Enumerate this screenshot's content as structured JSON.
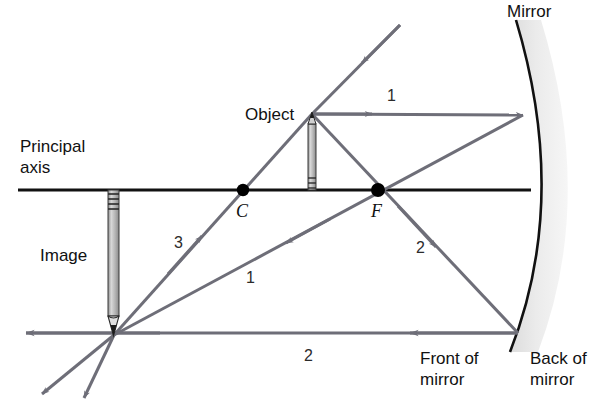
{
  "figure": {
    "title_text": "Concave mirror ray diagram",
    "background": "#ffffff",
    "width": 608,
    "height": 404
  },
  "colors": {
    "axis": "#111111",
    "ray": "#6e6e78",
    "mirror_line": "#111111",
    "mirror_body": "#e3e3e3",
    "point": "#000000",
    "text": "#111111",
    "pencil_body": "#c9c9c9"
  },
  "labels": {
    "principal_axis_line1": "Principal",
    "principal_axis_line2": "axis",
    "object": "Object",
    "image": "Image",
    "mirror": "Mirror",
    "front_of_mirror_line1": "Front of",
    "front_of_mirror_line2": "mirror",
    "back_of_mirror_line1": "Back of",
    "back_of_mirror_line2": "mirror",
    "center_of_curvature": "C",
    "focal_point": "F",
    "ray1_incident": "1",
    "ray1_reflected": "1",
    "ray2_incident": "2",
    "ray2_reflected": "2",
    "ray3": "3"
  },
  "geometry": {
    "principal_axis": {
      "x1": 18,
      "y": 190,
      "x2": 530
    },
    "center_of_curvature_point": {
      "x": 243,
      "y": 190
    },
    "focal_point": {
      "x": 378,
      "y": 190
    },
    "mirror_vertex": {
      "x": 530,
      "y": 190
    },
    "object": {
      "base_x": 312,
      "base_y": 190,
      "tip_y": 114,
      "height": 76
    },
    "image": {
      "base_x": 114,
      "base_y": 190,
      "tip_y": 335,
      "height": 145
    },
    "image_point": {
      "x": 114,
      "y": 335
    },
    "ray1_mirror_hit": {
      "x": 523,
      "y": 115
    },
    "ray2_mirror_hit": {
      "x": 518,
      "y": 333
    },
    "ray1_incident_tail": {
      "x": 400,
      "y": 25
    },
    "ray2_reflected_end": {
      "x": 28,
      "y": 333
    },
    "ray3_extension_end": {
      "x": 40,
      "y": 396
    },
    "ray1_extension_end": {
      "x": 82,
      "y": 400
    }
  },
  "label_positions": {
    "principal_axis": {
      "x": 20,
      "y": 152
    },
    "object": {
      "x": 245,
      "y": 118
    },
    "image": {
      "x": 40,
      "y": 261
    },
    "mirror": {
      "x": 507,
      "y": 16
    },
    "front_of_mirror": {
      "x": 420,
      "y": 362
    },
    "back_of_mirror": {
      "x": 530,
      "y": 362
    },
    "c_label": {
      "x": 237,
      "y": 215
    },
    "f_label": {
      "x": 372,
      "y": 215
    },
    "ray1_incident": {
      "x": 388,
      "y": 100
    },
    "ray1_reflected": {
      "x": 248,
      "y": 281
    },
    "ray2_incident": {
      "x": 417,
      "y": 252
    },
    "ray2_reflected": {
      "x": 305,
      "y": 360
    },
    "ray3": {
      "x": 176,
      "y": 246
    }
  }
}
